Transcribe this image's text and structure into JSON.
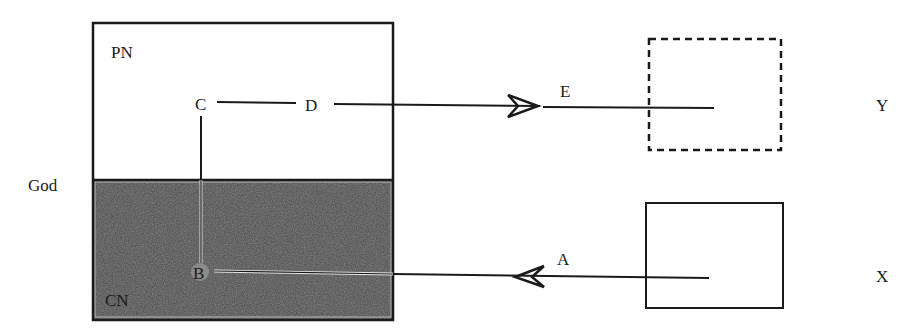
{
  "diagram": {
    "side_label": "God",
    "main_box": {
      "upper_label": "PN",
      "lower_label": "CN"
    },
    "nodes": {
      "c": "C",
      "d": "D",
      "b": "B",
      "e": "E",
      "a": "A"
    },
    "targets": {
      "y_label": "Y",
      "x_label": "X"
    },
    "colors": {
      "line": "#1a1a1a",
      "shaded_region": "#4a4a4a",
      "background": "#ffffff"
    }
  }
}
